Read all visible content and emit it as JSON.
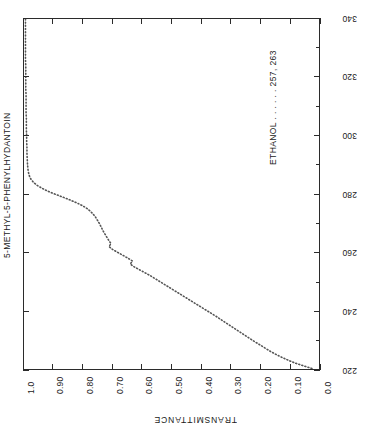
{
  "chart_data": {
    "type": "line",
    "title": "5-METHYL-5-PHENYLHYDANTOIN",
    "annotation": "ETHANOL . . . . . . 257, 263",
    "solvent": "ETHANOL",
    "peaks": "257, 263",
    "orientation": "rotated-90-landscape",
    "grid": false,
    "legend": "none",
    "line_style": "dotted",
    "xlabel": "TRANSMITTANCE",
    "xlim": [
      1.0,
      0.0
    ],
    "x_tick_labels": [
      "1.0",
      "0.90",
      "0.80",
      "0.70",
      "0.60",
      "0.50",
      "0.40",
      "0.30",
      "0.20",
      "0.10",
      "0.0"
    ],
    "x_tick_values": [
      1.0,
      0.9,
      0.8,
      0.7,
      0.6,
      0.5,
      0.4,
      0.3,
      0.2,
      0.1,
      0.0
    ],
    "ylabel": "WAVELENGTH (nm)",
    "ylim": [
      340,
      220
    ],
    "y_tick_labels": [
      "340",
      "320",
      "300",
      "280",
      "260",
      "240",
      "220"
    ],
    "y_tick_values": [
      340,
      320,
      300,
      280,
      260,
      240,
      220
    ],
    "y_minor_tick_values": [
      330,
      310,
      290,
      270,
      250,
      230
    ],
    "series": [
      {
        "name": "5-METHYL-5-PHENYLHYDANTOIN in ETHANOL",
        "x_label": "wavelength_nm",
        "y_label": "transmittance",
        "points": [
          [
            340,
            0.995
          ],
          [
            338,
            0.995
          ],
          [
            336,
            0.995
          ],
          [
            334,
            0.995
          ],
          [
            332,
            0.995
          ],
          [
            330,
            0.995
          ],
          [
            328,
            0.995
          ],
          [
            326,
            0.995
          ],
          [
            324,
            0.994
          ],
          [
            322,
            0.994
          ],
          [
            320,
            0.994
          ],
          [
            318,
            0.994
          ],
          [
            316,
            0.994
          ],
          [
            314,
            0.993
          ],
          [
            312,
            0.993
          ],
          [
            310,
            0.993
          ],
          [
            308,
            0.993
          ],
          [
            306,
            0.992
          ],
          [
            304,
            0.992
          ],
          [
            302,
            0.992
          ],
          [
            300,
            0.991
          ],
          [
            298,
            0.991
          ],
          [
            296,
            0.99
          ],
          [
            294,
            0.99
          ],
          [
            292,
            0.989
          ],
          [
            290,
            0.988
          ],
          [
            288,
            0.986
          ],
          [
            287,
            0.984
          ],
          [
            286,
            0.981
          ],
          [
            285,
            0.976
          ],
          [
            284,
            0.968
          ],
          [
            283,
            0.956
          ],
          [
            282,
            0.94
          ],
          [
            281,
            0.92
          ],
          [
            280,
            0.896
          ],
          [
            279,
            0.87
          ],
          [
            278,
            0.845
          ],
          [
            277,
            0.822
          ],
          [
            276,
            0.802
          ],
          [
            275,
            0.786
          ],
          [
            274,
            0.774
          ],
          [
            273,
            0.765
          ],
          [
            272,
            0.757
          ],
          [
            271,
            0.751
          ],
          [
            270,
            0.745
          ],
          [
            269,
            0.74
          ],
          [
            268,
            0.735
          ],
          [
            267,
            0.73
          ],
          [
            266,
            0.724
          ],
          [
            265,
            0.718
          ],
          [
            264,
            0.712
          ],
          [
            263,
            0.705
          ],
          [
            262,
            0.712
          ],
          [
            261,
            0.7
          ],
          [
            260,
            0.683
          ],
          [
            259,
            0.665
          ],
          [
            258,
            0.648
          ],
          [
            257,
            0.632
          ],
          [
            256,
            0.64
          ],
          [
            255,
            0.626
          ],
          [
            254,
            0.608
          ],
          [
            253,
            0.59
          ],
          [
            252,
            0.572
          ],
          [
            251,
            0.556
          ],
          [
            250,
            0.54
          ],
          [
            249,
            0.524
          ],
          [
            248,
            0.508
          ],
          [
            247,
            0.492
          ],
          [
            246,
            0.476
          ],
          [
            245,
            0.46
          ],
          [
            244,
            0.444
          ],
          [
            243,
            0.428
          ],
          [
            242,
            0.412
          ],
          [
            241,
            0.396
          ],
          [
            240,
            0.38
          ],
          [
            239,
            0.364
          ],
          [
            238,
            0.348
          ],
          [
            237,
            0.333
          ],
          [
            236,
            0.318
          ],
          [
            235,
            0.303
          ],
          [
            234,
            0.288
          ],
          [
            233,
            0.273
          ],
          [
            232,
            0.258
          ],
          [
            231,
            0.243
          ],
          [
            230,
            0.228
          ],
          [
            229,
            0.212
          ],
          [
            228,
            0.196
          ],
          [
            227,
            0.18
          ],
          [
            226,
            0.164
          ],
          [
            225,
            0.146
          ],
          [
            224,
            0.126
          ],
          [
            223,
            0.104
          ],
          [
            222,
            0.08
          ],
          [
            221,
            0.05
          ],
          [
            220,
            0.018
          ]
        ]
      }
    ]
  },
  "labels": {
    "title": "5-METHYL-5-PHENYLHYDANTOIN",
    "annotation": "ETHANOL . . . . . . 257, 263",
    "bottom_caption": "TRANSMITTANCE"
  },
  "colors": {
    "background": "#ffffff",
    "axis": "#2b2b2b",
    "text": "#1a1a1a",
    "curve": "#555555"
  }
}
